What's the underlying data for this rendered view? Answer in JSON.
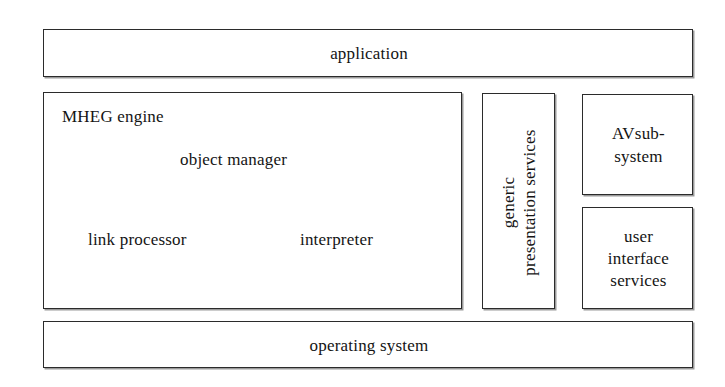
{
  "diagram": {
    "type": "layered-block-diagram",
    "background_color": "#ffffff",
    "line_color": "#2b2b2b",
    "text_color": "#141414",
    "layers": {
      "top": {
        "application": "application"
      },
      "middle": {
        "mheg_engine": {
          "title": "MHEG engine",
          "components": {
            "object_manager": "object manager",
            "link_processor": "link processor",
            "interpreter": "interpreter"
          }
        },
        "generic_presentation_services": {
          "line1": "generic",
          "line2": "presentation services",
          "orientation": "vertical-rotated-90-ccw"
        },
        "av_subsystem": {
          "line1": "AVsub-",
          "line2": "system"
        },
        "user_interface_services": {
          "line1": "user",
          "line2": "interface",
          "line3": "services"
        }
      },
      "bottom": {
        "operating_system": "operating system"
      }
    }
  }
}
